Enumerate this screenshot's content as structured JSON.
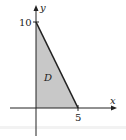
{
  "diagram": {
    "region_label": "D",
    "x_axis_label": "x",
    "y_axis_label": "y",
    "x_tick_label": "5",
    "y_tick_label": "10",
    "vertices": [
      [
        0,
        0
      ],
      [
        0,
        10
      ],
      [
        5,
        0
      ]
    ],
    "fill_color": "#c8c8c8",
    "line_color": "#222222"
  }
}
